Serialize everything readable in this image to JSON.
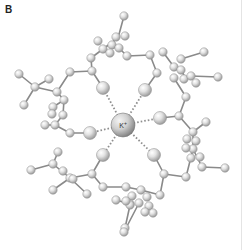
{
  "figure": {
    "panel_label": "B",
    "central_ion": {
      "label": "K",
      "charge": "+",
      "x": 123,
      "y": 125,
      "r": 12
    },
    "colors": {
      "bond": "#8a8a8a",
      "coordination": "#8f8f8f",
      "atom_light": "#f2f2f2",
      "atom_dark": "#a8a8a8",
      "ion_light": "#e6e6e6",
      "ion_dark": "#8c8c8c",
      "background": "#ffffff"
    },
    "oxygen_atoms": [
      {
        "x": 103,
        "y": 88,
        "r": 6.5
      },
      {
        "x": 145,
        "y": 90,
        "r": 6.5
      },
      {
        "x": 160,
        "y": 118,
        "r": 6.5
      },
      {
        "x": 154,
        "y": 155,
        "r": 6.5
      },
      {
        "x": 103,
        "y": 155,
        "r": 6.5
      },
      {
        "x": 90,
        "y": 133,
        "r": 6.5
      }
    ],
    "atoms": [
      {
        "x": 124,
        "y": 16
      },
      {
        "x": 116,
        "y": 37
      },
      {
        "x": 125,
        "y": 36
      },
      {
        "x": 98,
        "y": 41
      },
      {
        "x": 112,
        "y": 45
      },
      {
        "x": 119,
        "y": 48
      },
      {
        "x": 103,
        "y": 49
      },
      {
        "x": 110,
        "y": 53
      },
      {
        "x": 127,
        "y": 56
      },
      {
        "x": 91,
        "y": 58
      },
      {
        "x": 150,
        "y": 55
      },
      {
        "x": 92,
        "y": 71
      },
      {
        "x": 70,
        "y": 72
      },
      {
        "x": 157,
        "y": 73
      },
      {
        "x": 163,
        "y": 52
      },
      {
        "x": 181,
        "y": 59
      },
      {
        "x": 204,
        "y": 52
      },
      {
        "x": 174,
        "y": 67
      },
      {
        "x": 181,
        "y": 70
      },
      {
        "x": 174,
        "y": 78
      },
      {
        "x": 184,
        "y": 79
      },
      {
        "x": 191,
        "y": 76
      },
      {
        "x": 196,
        "y": 83
      },
      {
        "x": 218,
        "y": 77
      },
      {
        "x": 186,
        "y": 97
      },
      {
        "x": 179,
        "y": 116
      },
      {
        "x": 19,
        "y": 74
      },
      {
        "x": 35,
        "y": 87
      },
      {
        "x": 49,
        "y": 79
      },
      {
        "x": 24,
        "y": 105
      },
      {
        "x": 57,
        "y": 92
      },
      {
        "x": 64,
        "y": 100
      },
      {
        "x": 53,
        "y": 107
      },
      {
        "x": 63,
        "y": 115
      },
      {
        "x": 52,
        "y": 114
      },
      {
        "x": 55,
        "y": 125
      },
      {
        "x": 45,
        "y": 125
      },
      {
        "x": 70,
        "y": 133
      },
      {
        "x": 206,
        "y": 122
      },
      {
        "x": 193,
        "y": 132
      },
      {
        "x": 187,
        "y": 139
      },
      {
        "x": 196,
        "y": 141
      },
      {
        "x": 193,
        "y": 149
      },
      {
        "x": 200,
        "y": 157
      },
      {
        "x": 202,
        "y": 167
      },
      {
        "x": 225,
        "y": 168
      },
      {
        "x": 186,
        "y": 148
      },
      {
        "x": 191,
        "y": 158
      },
      {
        "x": 164,
        "y": 174
      },
      {
        "x": 186,
        "y": 177
      },
      {
        "x": 58,
        "y": 152
      },
      {
        "x": 31,
        "y": 170
      },
      {
        "x": 53,
        "y": 164
      },
      {
        "x": 63,
        "y": 171
      },
      {
        "x": 70,
        "y": 178
      },
      {
        "x": 73,
        "y": 179
      },
      {
        "x": 53,
        "y": 190
      },
      {
        "x": 87,
        "y": 194
      },
      {
        "x": 92,
        "y": 174
      },
      {
        "x": 103,
        "y": 187
      },
      {
        "x": 126,
        "y": 187
      },
      {
        "x": 141,
        "y": 190
      },
      {
        "x": 132,
        "y": 196
      },
      {
        "x": 147,
        "y": 197
      },
      {
        "x": 116,
        "y": 200
      },
      {
        "x": 130,
        "y": 204
      },
      {
        "x": 139,
        "y": 203
      },
      {
        "x": 149,
        "y": 206
      },
      {
        "x": 153,
        "y": 213
      },
      {
        "x": 130,
        "y": 205
      },
      {
        "x": 160,
        "y": 195
      },
      {
        "x": 145,
        "y": 212
      },
      {
        "x": 126,
        "y": 201
      },
      {
        "x": 125,
        "y": 228
      },
      {
        "x": 124,
        "y": 232
      }
    ],
    "bonds": [
      [
        124,
        16,
        118,
        38
      ],
      [
        118,
        38,
        103,
        49
      ],
      [
        103,
        49,
        91,
        58
      ],
      [
        91,
        58,
        92,
        71
      ],
      [
        92,
        71,
        103,
        88
      ],
      [
        119,
        48,
        127,
        56
      ],
      [
        127,
        56,
        150,
        55
      ],
      [
        150,
        55,
        157,
        73
      ],
      [
        157,
        73,
        145,
        90
      ],
      [
        163,
        52,
        174,
        67
      ],
      [
        181,
        59,
        204,
        52
      ],
      [
        174,
        67,
        181,
        70
      ],
      [
        181,
        70,
        186,
        79
      ],
      [
        191,
        76,
        218,
        77
      ],
      [
        174,
        78,
        186,
        97
      ],
      [
        186,
        97,
        179,
        116
      ],
      [
        179,
        116,
        160,
        118
      ],
      [
        19,
        74,
        35,
        87
      ],
      [
        35,
        87,
        49,
        79
      ],
      [
        35,
        87,
        24,
        105
      ],
      [
        35,
        87,
        57,
        92
      ],
      [
        57,
        92,
        70,
        72
      ],
      [
        70,
        72,
        92,
        71
      ],
      [
        57,
        92,
        64,
        100
      ],
      [
        64,
        100,
        53,
        107
      ],
      [
        64,
        100,
        63,
        115
      ],
      [
        63,
        115,
        55,
        125
      ],
      [
        55,
        125,
        45,
        125
      ],
      [
        55,
        125,
        70,
        133
      ],
      [
        70,
        133,
        90,
        133
      ],
      [
        179,
        116,
        193,
        132
      ],
      [
        206,
        122,
        193,
        132
      ],
      [
        193,
        132,
        193,
        149
      ],
      [
        193,
        149,
        202,
        167
      ],
      [
        202,
        167,
        225,
        168
      ],
      [
        193,
        149,
        186,
        177
      ],
      [
        186,
        177,
        164,
        174
      ],
      [
        164,
        174,
        154,
        155
      ],
      [
        58,
        152,
        53,
        164
      ],
      [
        31,
        170,
        53,
        164
      ],
      [
        53,
        164,
        70,
        178
      ],
      [
        70,
        178,
        53,
        190
      ],
      [
        70,
        178,
        87,
        194
      ],
      [
        70,
        178,
        92,
        174
      ],
      [
        92,
        174,
        103,
        155
      ],
      [
        92,
        174,
        103,
        187
      ],
      [
        103,
        187,
        126,
        187
      ],
      [
        126,
        187,
        141,
        190
      ],
      [
        141,
        190,
        160,
        195
      ],
      [
        160,
        195,
        164,
        174
      ],
      [
        132,
        196,
        125,
        228
      ],
      [
        139,
        203,
        124,
        232
      ],
      [
        116,
        200,
        130,
        204
      ]
    ],
    "coordination_bonds": [
      [
        123,
        125,
        103,
        88
      ],
      [
        123,
        125,
        145,
        90
      ],
      [
        123,
        125,
        160,
        118
      ],
      [
        123,
        125,
        154,
        155
      ],
      [
        123,
        125,
        103,
        155
      ],
      [
        123,
        125,
        90,
        133
      ]
    ]
  }
}
